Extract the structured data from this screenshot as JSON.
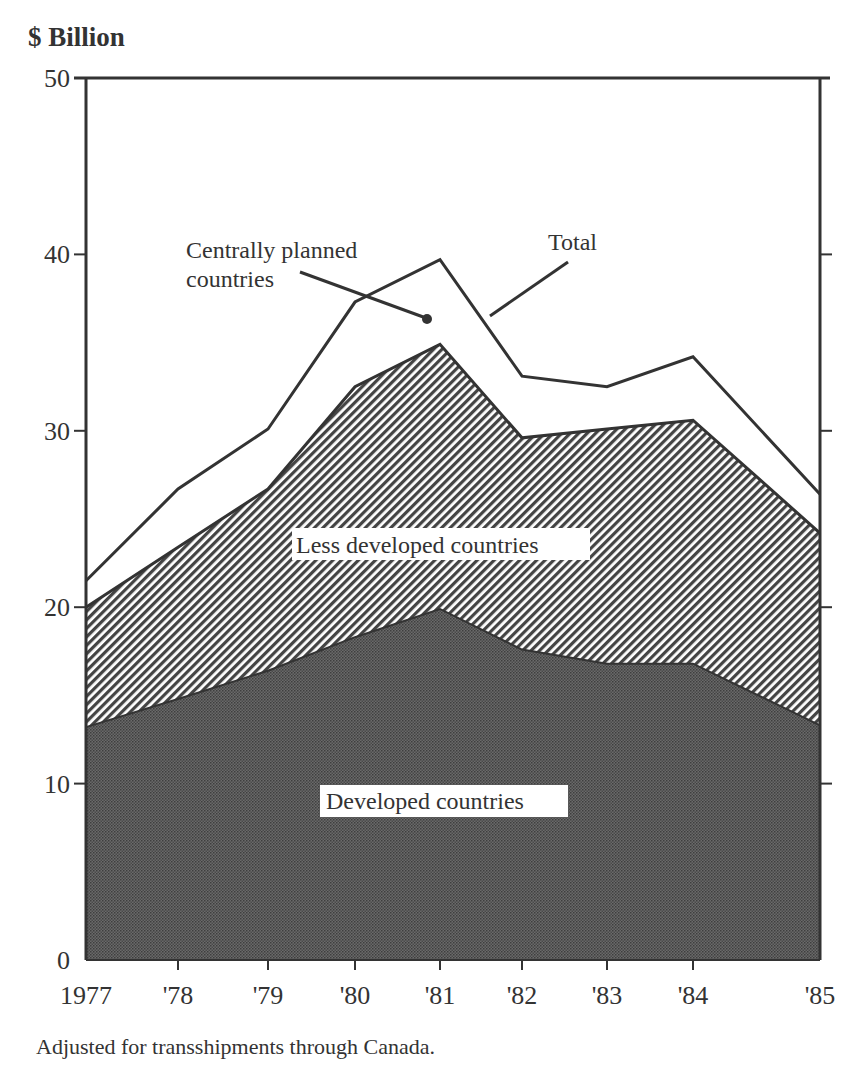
{
  "chart_data": {
    "type": "area",
    "stacked": true,
    "title": "",
    "ylabel": "$ Billion",
    "xlabel": "",
    "x": [
      "1977",
      "'78",
      "'79",
      "'80",
      "'81",
      "'82",
      "'83",
      "'84",
      "'85"
    ],
    "ylim": [
      0,
      50
    ],
    "yticks": [
      0,
      10,
      20,
      30,
      40,
      50
    ],
    "grid": false,
    "series": [
      {
        "name": "Developed countries",
        "cumulative_top": [
          13.2,
          14.8,
          16.4,
          18.3,
          19.9,
          17.6,
          16.8,
          16.8,
          13.3
        ],
        "fill": "dense-dot"
      },
      {
        "name": "Less developed countries",
        "cumulative_top": [
          20.0,
          23.4,
          26.7,
          32.5,
          34.9,
          29.6,
          30.1,
          30.6,
          24.2
        ],
        "fill": "diagonal-hatch"
      },
      {
        "name": "Centrally planned countries",
        "cumulative_top": [
          21.5,
          26.7,
          30.1,
          37.3,
          39.7,
          33.1,
          32.5,
          34.2,
          26.4
        ],
        "fill": "white"
      }
    ],
    "values_by_component": {
      "Developed countries": [
        13.2,
        14.8,
        16.4,
        18.3,
        19.9,
        17.6,
        16.8,
        16.8,
        13.3
      ],
      "Less developed countries": [
        6.8,
        8.6,
        10.3,
        14.2,
        15.0,
        12.0,
        13.3,
        13.8,
        10.9
      ],
      "Centrally planned countries": [
        1.5,
        3.3,
        3.4,
        4.8,
        4.8,
        3.5,
        2.4,
        3.6,
        2.2
      ],
      "Total": [
        21.5,
        26.7,
        30.1,
        37.3,
        39.7,
        33.1,
        32.5,
        34.2,
        26.4
      ]
    },
    "annotations": [
      {
        "text": "Centrally planned countries",
        "line1": "Centrally planned",
        "line2": "countries"
      },
      {
        "text": "Total"
      },
      {
        "text": "Less developed countries"
      },
      {
        "text": "Developed countries"
      }
    ],
    "footnote": "Adjusted for transshipments through Canada."
  },
  "labels": {
    "y_title": "$ Billion",
    "footnote": "Adjusted for transshipments through Canada.",
    "cpc_line1": "Centrally planned",
    "cpc_line2": "countries",
    "total": "Total",
    "ldc": "Less developed countries",
    "dc": "Developed countries"
  },
  "layout": {
    "x_px": [
      86,
      178,
      268,
      355,
      440,
      522,
      607,
      693,
      820
    ],
    "y0_px": 960,
    "y50_px": 78,
    "colors": {
      "ink": "#333333",
      "dark_fill": "#5a5a5a"
    }
  }
}
